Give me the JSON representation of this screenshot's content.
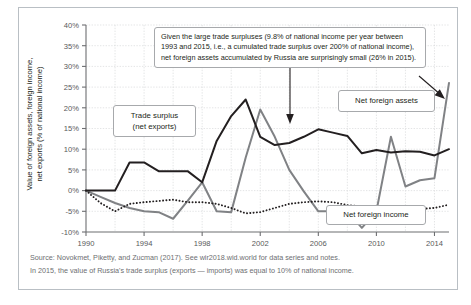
{
  "figure": {
    "y_axis_title_line1": "Value of foreign assets, foreign income,",
    "y_axis_title_line2": "net exports (% of national income)",
    "annotation": "Given the large trade surpluses (9.8% of national income per year between 1993 and 2015, i.e., a cumulated trade surplus over 200% of national income), net foreign assets accumulated by Russia are surprisingly small (26% in 2015).",
    "label_trade_surplus_line1": "Trade surplus",
    "label_trade_surplus_line2": "(net exports)",
    "label_net_foreign_assets": "Net foreign assets",
    "label_net_foreign_income": "Net foreign income",
    "note_source": "Source: Novokmet, Piketty, and Zucman (2017). See wir2018.wid.world for data series and notes.",
    "note_reading": "In 2015, the value of Russia's trade surplus (exports — imports) was equal to 10% of national income.",
    "color_black": "#231f20",
    "color_gray": "#808285",
    "color_grid": "#d8dadb",
    "color_axis": "#6d6e71",
    "color_frame": "#b9bfc4"
  },
  "chart_data": {
    "type": "line",
    "title": "",
    "xlabel": "",
    "ylabel": "Value of foreign assets, foreign income, net exports (% of national income)",
    "xlim": [
      1990,
      2015
    ],
    "ylim": [
      -10,
      40
    ],
    "ytick_labels": [
      "40%",
      "35%",
      "30%",
      "25%",
      "20%",
      "15%",
      "10%",
      "5%",
      "0%",
      "-5%",
      "-10%"
    ],
    "ytick_values": [
      40,
      35,
      30,
      25,
      20,
      15,
      10,
      5,
      0,
      -5,
      -10
    ],
    "xtick_labels": [
      "1990",
      "1994",
      "1998",
      "2002",
      "2006",
      "2010",
      "2014"
    ],
    "xtick_values": [
      1990,
      1994,
      1998,
      2002,
      2006,
      2010,
      2014
    ],
    "grid": true,
    "legend": "annotated labels on plot",
    "x": [
      1990,
      1991,
      1992,
      1993,
      1994,
      1995,
      1996,
      1997,
      1998,
      1999,
      2000,
      2001,
      2002,
      2003,
      2004,
      2005,
      2006,
      2007,
      2008,
      2009,
      2010,
      2011,
      2012,
      2013,
      2014,
      2015
    ],
    "series": [
      {
        "name": "Trade surplus (net exports)",
        "color": "#231f20",
        "style": "solid",
        "values": [
          0.0,
          0.0,
          0.0,
          6.8,
          6.8,
          4.7,
          4.7,
          4.7,
          2.0,
          12.0,
          18.0,
          22.0,
          13.0,
          11.0,
          11.5,
          13.0,
          14.8,
          14.0,
          13.2,
          9.0,
          9.8,
          9.2,
          9.5,
          9.4,
          8.5,
          10.0
        ]
      },
      {
        "name": "Net foreign assets",
        "color": "#808285",
        "style": "solid",
        "values": [
          0.0,
          -1.5,
          -3.0,
          -4.2,
          -5.0,
          -5.2,
          -6.8,
          -2.5,
          2.0,
          -5.0,
          -5.2,
          8.0,
          19.6,
          13.0,
          5.0,
          -0.2,
          -5.0,
          -5.0,
          -5.0,
          -9.0,
          -5.0,
          13.0,
          1.0,
          2.5,
          3.0,
          26.0
        ]
      },
      {
        "name": "Net foreign income",
        "color": "#231f20",
        "style": "dotted",
        "values": [
          0.0,
          -3.0,
          -5.0,
          -3.2,
          -2.8,
          -2.5,
          -2.2,
          -2.8,
          -2.8,
          -3.2,
          -4.2,
          -5.5,
          -5.2,
          -4.2,
          -3.2,
          -2.8,
          -2.6,
          -2.8,
          -3.5,
          -3.8,
          -3.8,
          -4.0,
          -4.5,
          -4.4,
          -4.2,
          -3.4
        ]
      }
    ]
  }
}
